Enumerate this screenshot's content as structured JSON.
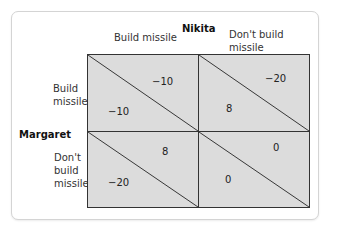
{
  "matrix": {
    "column_player": "Nikita",
    "row_player": "Margaret",
    "columns": [
      "Build missile",
      "Don't build missile"
    ],
    "column_labels": [
      [
        "Build missile"
      ],
      [
        "Don't build",
        "missile"
      ]
    ],
    "rows": [
      "Build missile",
      "Don't build missile"
    ],
    "row_labels": [
      [
        "Build",
        "missile"
      ],
      [
        "Don't",
        "build",
        "missile"
      ]
    ],
    "cells": [
      {
        "row": "Build missile",
        "col": "Build missile",
        "nikita_payoff": "−10",
        "margaret_payoff": "−10"
      },
      {
        "row": "Build missile",
        "col": "Don't build missile",
        "nikita_payoff": "−20",
        "margaret_payoff": "8"
      },
      {
        "row": "Don't build missile",
        "col": "Build missile",
        "nikita_payoff": "8",
        "margaret_payoff": "−20"
      },
      {
        "row": "Don't build missile",
        "col": "Don't build missile",
        "nikita_payoff": "0",
        "margaret_payoff": "0"
      }
    ],
    "cell_color": "#dcdcdc",
    "line_color": "#333333"
  }
}
